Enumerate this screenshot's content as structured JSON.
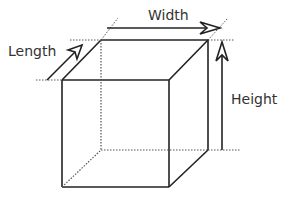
{
  "diagram": {
    "labels": {
      "length": "Length",
      "width": "Width",
      "height": "Height"
    },
    "colors": {
      "stroke": "#222222",
      "dotted": "#555555",
      "text": "#333333",
      "background": "#ffffff"
    }
  }
}
